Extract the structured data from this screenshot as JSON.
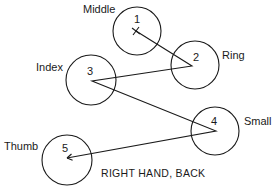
{
  "diagram": {
    "caption": "RIGHT HAND, BACK",
    "colors": {
      "ink": "#1a1a1a",
      "background": "#ffffff"
    },
    "fingers": [
      {
        "order": "1",
        "name": "Middle",
        "cx": 137,
        "cy": 31,
        "r": 24,
        "label_x": 83,
        "label_y": 13,
        "num_x": 137,
        "num_y": 23,
        "px": 136,
        "py": 31
      },
      {
        "order": "2",
        "name": "Ring",
        "cx": 195,
        "cy": 65,
        "r": 24,
        "label_x": 222,
        "label_y": 59,
        "num_x": 196,
        "num_y": 61,
        "px": 192,
        "py": 66
      },
      {
        "order": "3",
        "name": "Index",
        "cx": 91,
        "cy": 80,
        "r": 25,
        "label_x": 36,
        "label_y": 71,
        "num_x": 90,
        "num_y": 75,
        "px": 92,
        "py": 81
      },
      {
        "order": "4",
        "name": "Small",
        "cx": 215,
        "cy": 131,
        "r": 24,
        "label_x": 244,
        "label_y": 125,
        "num_x": 214,
        "num_y": 125,
        "px": 216,
        "py": 131
      },
      {
        "order": "5",
        "name": "Thumb",
        "cx": 67,
        "cy": 160,
        "r": 25,
        "label_x": 4,
        "label_y": 150,
        "num_x": 65,
        "num_y": 152,
        "px": 67,
        "py": 158
      }
    ],
    "sequence": [
      "1",
      "2",
      "3",
      "4",
      "5"
    ],
    "start_marker": "x-mark",
    "end_marker": "arrowhead"
  }
}
